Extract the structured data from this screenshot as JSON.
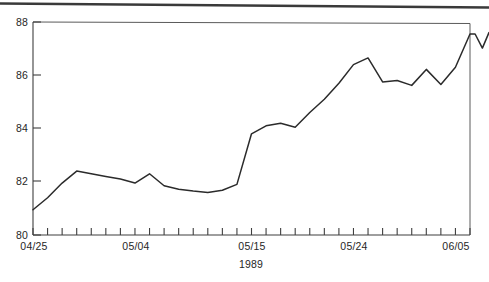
{
  "figure": {
    "width": 489,
    "height": 282,
    "background": "#ffffff",
    "ink_color": "#2b2b2b",
    "axis_color": "#4a4a4a",
    "scan_artifact": {
      "name": "scan-edge-artifact",
      "color": "#3a3a3a",
      "left_y": 3,
      "right_y": 7
    }
  },
  "plot_box": {
    "left": 33,
    "right": 470,
    "top": 22,
    "bottom": 235
  },
  "chart_data": {
    "type": "line",
    "title": "",
    "subtitle": "",
    "xlabel": "1989",
    "ylabel": "",
    "ylim": [
      80,
      88
    ],
    "xlim": [
      0,
      30
    ],
    "grid": false,
    "legend": null,
    "y_ticks": [
      80,
      82,
      84,
      86,
      88
    ],
    "y_tick_labels": [
      "80",
      "82",
      "84",
      "86",
      "88"
    ],
    "x_tick_count": 30,
    "x_labeled_ticks": [
      {
        "index": 0,
        "label": "04/25"
      },
      {
        "index": 7,
        "label": "05/04"
      },
      {
        "index": 15,
        "label": "05/15"
      },
      {
        "index": 22,
        "label": "05/24"
      },
      {
        "index": 29,
        "label": "06/05"
      }
    ],
    "series": [
      {
        "name": "value",
        "color": "#2b2b2b",
        "x": [
          0,
          1,
          2,
          3,
          4,
          5,
          6,
          7,
          8,
          9,
          10,
          11,
          12,
          13,
          14,
          15,
          16,
          17,
          18,
          19,
          20,
          21,
          22,
          23,
          24,
          25,
          26,
          27,
          28,
          29,
          30
        ],
        "values": [
          80.95,
          81.4,
          81.95,
          82.4,
          82.3,
          82.2,
          82.1,
          81.95,
          82.3,
          81.85,
          81.72,
          81.65,
          81.6,
          81.68,
          81.9,
          83.8,
          84.1,
          84.2,
          84.05,
          84.6,
          85.1,
          85.7,
          86.4,
          86.65,
          85.75,
          85.8,
          85.62,
          86.22,
          85.65,
          86.3,
          87.55
        ],
        "tail_points": [
          {
            "x": 30.35,
            "value": 87.55
          },
          {
            "x": 30.85,
            "value": 87.02
          },
          {
            "x": 31.3,
            "value": 87.6
          }
        ]
      }
    ]
  }
}
